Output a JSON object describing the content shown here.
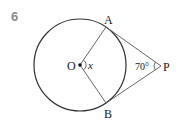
{
  "problem": {
    "number": "6"
  },
  "diagram": {
    "circle": {
      "cx": 80,
      "cy": 65,
      "r": 46,
      "stroke": "#333333"
    },
    "points": {
      "O": {
        "label": "O",
        "x": 80,
        "y": 65
      },
      "A": {
        "label": "A",
        "x": 106,
        "y": 27
      },
      "B": {
        "label": "B",
        "x": 106,
        "y": 103
      },
      "P": {
        "label": "P",
        "x": 161,
        "y": 66
      }
    },
    "angle_labels": {
      "center_angle": "x",
      "p_angle": "70°"
    },
    "segments": [
      "OA",
      "OB",
      "PA",
      "PB"
    ]
  }
}
